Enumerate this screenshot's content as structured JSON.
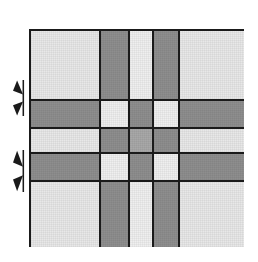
{
  "figure": {
    "canvas": {
      "width": 258,
      "height": 262,
      "background": "#ffffff"
    }
  },
  "grid": {
    "rows": 5,
    "columns": 5,
    "bounds": {
      "left": 29,
      "top": 29,
      "width": 215,
      "height": 218
    },
    "border_color": "#1a1a1a",
    "border_width": 2,
    "gap": 2,
    "column_widths": [
      68,
      27,
      22,
      24,
      64
    ],
    "row_heights": [
      68,
      26,
      23,
      26,
      65
    ],
    "colors": {
      "light": "#e8e8e8",
      "pale": "#efefef",
      "dark": "#8e8e8e",
      "mid": "#a8a8a8"
    },
    "cells": [
      [
        {
          "tone": "light",
          "name": "cell-r1c1"
        },
        {
          "tone": "dark",
          "name": "cell-r1c2"
        },
        {
          "tone": "pale",
          "name": "cell-r1c3"
        },
        {
          "tone": "dark",
          "name": "cell-r1c4"
        },
        {
          "tone": "light",
          "name": "cell-r1c5"
        }
      ],
      [
        {
          "tone": "dark",
          "name": "cell-r2c1"
        },
        {
          "tone": "pale",
          "name": "cell-r2c2"
        },
        {
          "tone": "dark",
          "name": "cell-r2c3"
        },
        {
          "tone": "pale",
          "name": "cell-r2c4"
        },
        {
          "tone": "dark",
          "name": "cell-r2c5"
        }
      ],
      [
        {
          "tone": "light",
          "name": "cell-r3c1"
        },
        {
          "tone": "dark",
          "name": "cell-r3c2"
        },
        {
          "tone": "mid",
          "name": "cell-r3c3"
        },
        {
          "tone": "dark",
          "name": "cell-r3c4"
        },
        {
          "tone": "light",
          "name": "cell-r3c5"
        }
      ],
      [
        {
          "tone": "dark",
          "name": "cell-r4c1"
        },
        {
          "tone": "pale",
          "name": "cell-r4c2"
        },
        {
          "tone": "dark",
          "name": "cell-r4c3"
        },
        {
          "tone": "pale",
          "name": "cell-r4c4"
        },
        {
          "tone": "dark",
          "name": "cell-r4c5"
        }
      ],
      [
        {
          "tone": "light",
          "name": "cell-r5c1"
        },
        {
          "tone": "dark",
          "name": "cell-r5c2"
        },
        {
          "tone": "pale",
          "name": "cell-r5c3"
        },
        {
          "tone": "dark",
          "name": "cell-r5c4"
        },
        {
          "tone": "light",
          "name": "cell-r5c5"
        }
      ]
    ]
  },
  "markers": [
    {
      "name": "band-marker-upper",
      "icon": "double-arrow-right-icon",
      "left": 12,
      "top": 80,
      "width": 17,
      "height": 36,
      "color": "#1a1a1a"
    },
    {
      "name": "band-marker-lower",
      "icon": "double-arrow-right-icon",
      "left": 12,
      "top": 150,
      "width": 17,
      "height": 42,
      "color": "#1a1a1a"
    }
  ]
}
